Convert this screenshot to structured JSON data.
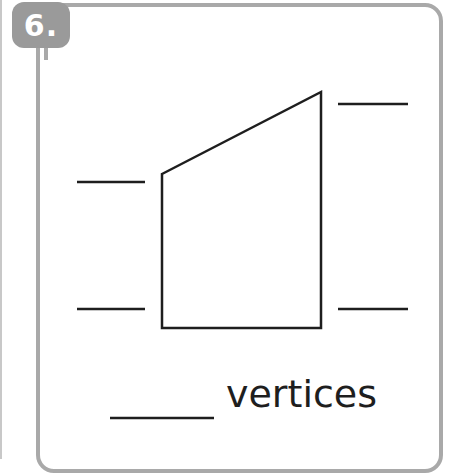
{
  "problem": {
    "number_label": "6.",
    "caption": "vertices"
  },
  "figure": {
    "shape": "quadrilateral",
    "vertices": [
      [
        162,
        174
      ],
      [
        321,
        92
      ],
      [
        321,
        328
      ],
      [
        162,
        328
      ]
    ],
    "label_blanks": [
      {
        "position": "left-upper",
        "x1": 77,
        "x2": 145,
        "y": 182
      },
      {
        "position": "left-lower",
        "x1": 77,
        "x2": 145,
        "y": 309
      },
      {
        "position": "right-upper",
        "x1": 338,
        "x2": 408,
        "y": 104
      },
      {
        "position": "right-lower",
        "x1": 338,
        "x2": 408,
        "y": 309
      }
    ],
    "answer_blank": {
      "x1": 110,
      "x2": 214,
      "y": 418
    }
  },
  "colors": {
    "border": "#a9a9a9",
    "badge": "#9a9a9a",
    "ink": "#1e1e1e"
  }
}
